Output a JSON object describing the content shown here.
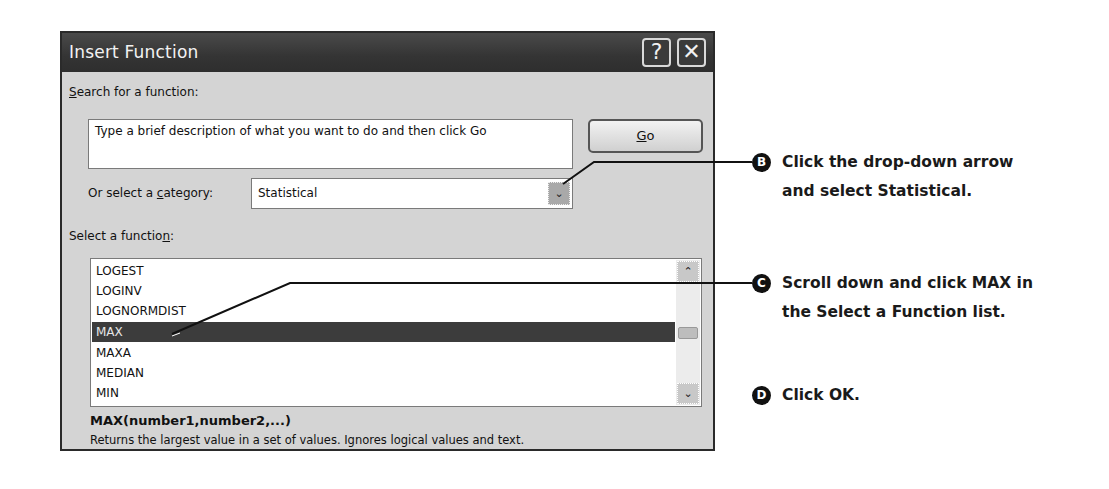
{
  "dialog": {
    "title": "Insert Function",
    "help_button": "?",
    "close_button": "✕",
    "search_label_prefix": "",
    "search_label_accel": "S",
    "search_label_rest": "earch for a function:",
    "search_text": "Type a brief description of what you want to do and then click Go",
    "go_button_accel": "G",
    "go_button_rest": "o",
    "category_label_pre": "Or select a ",
    "category_label_accel": "c",
    "category_label_post": "ategory:",
    "category_value": "Statistical",
    "category_arrow": "⌄",
    "function_label_pre": "Select a functio",
    "function_label_accel": "n",
    "function_label_post": ":",
    "functions": [
      "LOGEST",
      "LOGINV",
      "LOGNORMDIST",
      "MAX",
      "MAXA",
      "MEDIAN",
      "MIN"
    ],
    "selected_function": "MAX",
    "scroll_up": "⌃",
    "scroll_down": "⌄",
    "formula": "MAX(number1,number2,...)",
    "description": "Returns the largest value in a set of values. Ignores logical values and text."
  },
  "callouts": [
    {
      "badge": "B",
      "line1": "Click the drop-down arrow",
      "line2": "and select Statistical."
    },
    {
      "badge": "C",
      "line1": "Scroll down and click MAX in",
      "line2": "the Select a Function list."
    },
    {
      "badge": "D",
      "line1": "Click OK.",
      "line2": ""
    }
  ]
}
